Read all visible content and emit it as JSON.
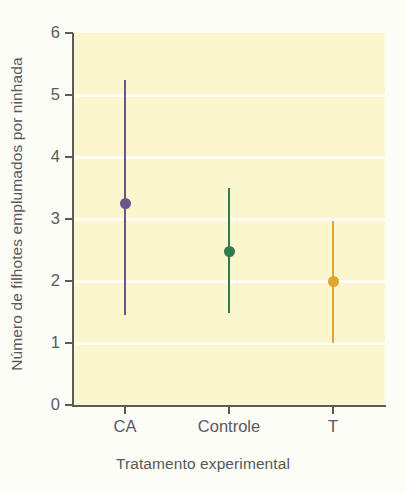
{
  "chart_data": {
    "type": "scatter",
    "title": "",
    "xlabel": "Tratamento experimental",
    "ylabel": "Número de filhotes emplumados por ninhada",
    "categories": [
      "CA",
      "Controle",
      "T"
    ],
    "ylim": [
      0,
      6
    ],
    "yticks": [
      0,
      1,
      2,
      3,
      4,
      5,
      6
    ],
    "ytick_labels": [
      "0",
      "1",
      "2",
      "3",
      "4",
      "5",
      "6"
    ],
    "grid": true,
    "legend": "none",
    "plot_background": "#fbf6cd",
    "series": [
      {
        "name": "CA",
        "x": "CA",
        "value": 3.25,
        "lower": 1.45,
        "upper": 5.25,
        "color": "#6c558f"
      },
      {
        "name": "Controle",
        "x": "Controle",
        "value": 2.47,
        "lower": 1.48,
        "upper": 3.5,
        "color": "#2e7d4f"
      },
      {
        "name": "T",
        "x": "T",
        "value": 2.0,
        "lower": 1.0,
        "upper": 2.97,
        "color": "#e0a82e"
      }
    ]
  },
  "axes": {
    "y_title": "Número de filhotes emplumados por ninhada",
    "x_title": "Tratamento experimental",
    "y_labels": [
      "6",
      "5",
      "4",
      "3",
      "2",
      "1",
      "0"
    ],
    "x_labels": [
      "CA",
      "Controle",
      "T"
    ]
  }
}
